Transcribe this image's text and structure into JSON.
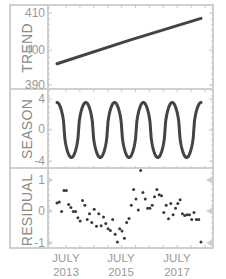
{
  "chart_data": [
    {
      "type": "line",
      "title": "",
      "ylabel": "TREND",
      "xlabel": "",
      "ylim": [
        389,
        411
      ],
      "yticks": [
        390,
        400,
        410
      ],
      "x_start": "2013-01",
      "x_end": "2017-12",
      "series": [
        {
          "name": "TREND",
          "start": 395.9,
          "end": 408.5
        }
      ],
      "grid": false
    },
    {
      "type": "line",
      "title": "",
      "ylabel": "SEASON",
      "xlabel": "",
      "ylim": [
        -4.3,
        4.3
      ],
      "yticks": [
        -4,
        0,
        4
      ],
      "series": [
        {
          "name": "SEASON",
          "amplitude": 3.55,
          "period_years": 1,
          "cycles": 5,
          "end_value": 3.3
        }
      ],
      "grid": false
    },
    {
      "type": "scatter",
      "title": "",
      "ylabel": "RESIDUAL",
      "xlabel": "",
      "ylim": [
        -1.15,
        1.45
      ],
      "yticks": [
        -1,
        0,
        1
      ],
      "series": [
        {
          "name": "RESIDUAL",
          "values": [
            0.27,
            0.3,
            0.0,
            0.67,
            0.67,
            0.22,
            0.13,
            0.0,
            0.0,
            -0.2,
            -0.3,
            0.35,
            0.2,
            -0.25,
            -0.07,
            -0.35,
            0.07,
            -0.47,
            -0.07,
            -0.45,
            -0.17,
            -0.38,
            -0.55,
            -0.6,
            -0.25,
            -0.72,
            -0.97,
            -0.55,
            -0.62,
            -0.85,
            -0.35,
            -0.22,
            0.2,
            0.7,
            0.4,
            0.05,
            1.3,
            0.6,
            0.4,
            0.1,
            0.1,
            0.2,
            0.47,
            0.7,
            0.53,
            0.5,
            -0.03,
            0.2,
            -0.23,
            0.25,
            -0.1,
            0.1,
            0.25,
            0.37,
            -0.07,
            -0.13,
            -0.1,
            -0.1,
            -0.25,
            -0.03,
            -0.25,
            -0.25,
            -0.97
          ]
        }
      ],
      "grid": false
    }
  ],
  "x_axis": {
    "ticks": [
      {
        "line1": "JULY",
        "line2": "2013"
      },
      {
        "line1": "JULY",
        "line2": "2015"
      },
      {
        "line1": "JULY",
        "line2": "2017"
      }
    ]
  },
  "panels": {
    "trend": {
      "title": "TREND",
      "ticks": [
        "410",
        "400",
        "390"
      ]
    },
    "season": {
      "title": "SEASON",
      "ticks": [
        "4",
        "0",
        "-4"
      ]
    },
    "residual": {
      "title": "RESIDUAL",
      "ticks": [
        "1",
        "0",
        "-1"
      ]
    }
  },
  "colors": {
    "line": "#444444",
    "frame": "#cfcfcf",
    "text": "#9a9a9a"
  }
}
